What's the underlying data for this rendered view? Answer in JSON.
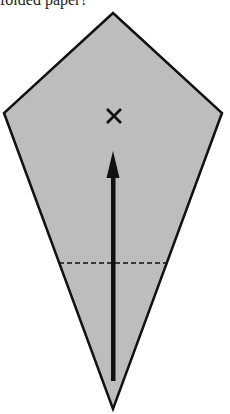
{
  "caption": "folded paper?",
  "diagram": {
    "shape": "kite",
    "fill_color": "#bdbdbd",
    "stroke_color": "#111111",
    "vertices": {
      "top": [
        113,
        13
      ],
      "right": [
        222,
        113
      ],
      "bottom": [
        113,
        409
      ],
      "left": [
        4,
        113
      ]
    },
    "marker": {
      "symbol": "×",
      "center": [
        114,
        116
      ]
    },
    "arrow": {
      "direction": "up",
      "tail": [
        113,
        381
      ],
      "tip": [
        113,
        152
      ]
    },
    "fold_line": {
      "style": "dashed",
      "y": 263,
      "x_start": 59,
      "x_end": 167
    }
  }
}
